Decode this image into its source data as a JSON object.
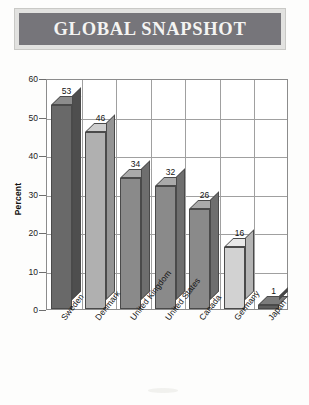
{
  "banner": {
    "title": "GLOBAL SNAPSHOT",
    "banner_fill": "#76757a",
    "banner_border": "#e2e2e0",
    "title_color": "#f4f4f2"
  },
  "chart_data": {
    "type": "bar",
    "title": "GLOBAL SNAPSHOT",
    "xlabel": "",
    "ylabel": "Percent",
    "categories": [
      "Sweden",
      "Denmark",
      "United Kingdom",
      "United States",
      "Canada",
      "Germany",
      "Japan"
    ],
    "values": [
      53,
      46,
      34,
      32,
      26,
      16,
      1
    ],
    "value_labels": [
      "53",
      "46",
      "34",
      "32",
      "26",
      "16",
      "1"
    ],
    "ylim": [
      0,
      60
    ],
    "yticks": [
      0,
      10,
      20,
      30,
      40,
      50,
      60
    ],
    "ytick_labels": [
      "0",
      "10",
      "20",
      "30",
      "40",
      "50",
      "60"
    ],
    "grid": true,
    "legend": "none",
    "style": "3d-column",
    "bar_colors": [
      "#696969",
      "#b0b0b0",
      "#8a8a8a",
      "#8a8a8a",
      "#8a8a8a",
      "#d2d2d2",
      "#5e5e5e"
    ],
    "bar_top_colors": [
      "#8c8c8c",
      "#cecece",
      "#aaaaaa",
      "#aaaaaa",
      "#aaaaaa",
      "#e8e8e8",
      "#7c7c7c"
    ],
    "bar_side_colors": [
      "#4e4e4e",
      "#949494",
      "#6e6e6e",
      "#6e6e6e",
      "#6e6e6e",
      "#b4b4b4",
      "#464646"
    ]
  }
}
